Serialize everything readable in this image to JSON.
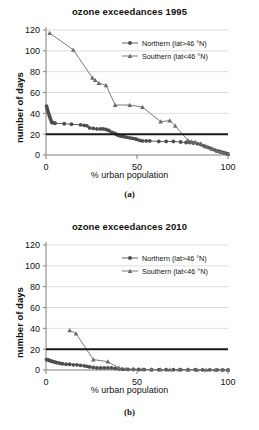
{
  "figure": {
    "panels": [
      {
        "caption": "(a)",
        "chart_data": {
          "type": "line",
          "title": "ozone exceedances 1995",
          "xlabel": "% urban population",
          "ylabel": "number of days",
          "xlim": [
            0,
            100
          ],
          "ylim": [
            0,
            120
          ],
          "xticks": [
            0,
            50,
            100
          ],
          "yticks": [
            0,
            20,
            40,
            60,
            80,
            100,
            120
          ],
          "grid": "horizontal",
          "legend_position": "top-right",
          "threshold_line": {
            "label": "limit value",
            "value": 20,
            "color": "#1a1a1a"
          },
          "series": [
            {
              "name": "Northern (lat>46 °N)",
              "marker": "circle",
              "color": "#4d4d4d",
              "points": [
                [
                  0.3,
                  47
                ],
                [
                  0.6,
                  45
                ],
                [
                  0.9,
                  43
                ],
                [
                  1.2,
                  41
                ],
                [
                  1.6,
                  39
                ],
                [
                  2.0,
                  37
                ],
                [
                  2.4,
                  35
                ],
                [
                  2.8,
                  33
                ],
                [
                  3.2,
                  31
                ],
                [
                  4.0,
                  31
                ],
                [
                  5.0,
                  30.5
                ],
                [
                  10.0,
                  30
                ],
                [
                  14.0,
                  29.5
                ],
                [
                  19.0,
                  29
                ],
                [
                  21.0,
                  28.5
                ],
                [
                  22.5,
                  28
                ],
                [
                  24.0,
                  26
                ],
                [
                  26.0,
                  25.5
                ],
                [
                  28.0,
                  25
                ],
                [
                  30.0,
                  25
                ],
                [
                  31.5,
                  25
                ],
                [
                  33.0,
                  24.5
                ],
                [
                  34.5,
                  23.5
                ],
                [
                  36.0,
                  22
                ],
                [
                  37.5,
                  21
                ],
                [
                  38.5,
                  20
                ],
                [
                  39.5,
                  19
                ],
                [
                  40.5,
                  18.5
                ],
                [
                  41.5,
                  18
                ],
                [
                  43.0,
                  17.5
                ],
                [
                  44.5,
                  17
                ],
                [
                  46.0,
                  16.5
                ],
                [
                  47.5,
                  16
                ],
                [
                  49.0,
                  15.5
                ],
                [
                  50.0,
                  15
                ],
                [
                  51.5,
                  14
                ],
                [
                  53.0,
                  13.5
                ],
                [
                  55.0,
                  13.5
                ],
                [
                  57.0,
                  13.5
                ],
                [
                  62.0,
                  13
                ],
                [
                  66.0,
                  13
                ],
                [
                  70.0,
                  13
                ],
                [
                  74.0,
                  12.5
                ],
                [
                  77.0,
                  12
                ],
                [
                  79.0,
                  12
                ],
                [
                  81.0,
                  11.5
                ],
                [
                  83.0,
                  11
                ],
                [
                  85.0,
                  10
                ],
                [
                  86.5,
                  9
                ],
                [
                  88.0,
                  8
                ],
                [
                  89.5,
                  7
                ],
                [
                  91.0,
                  6
                ],
                [
                  92.5,
                  5
                ],
                [
                  94.0,
                  4
                ],
                [
                  95.0,
                  3.5
                ],
                [
                  96.0,
                  3
                ],
                [
                  97.0,
                  2.5
                ],
                [
                  98.0,
                  2
                ],
                [
                  99.0,
                  1.5
                ],
                [
                  100.0,
                  1
                ]
              ]
            },
            {
              "name": "Southern (lat<46 °N)",
              "marker": "triangle",
              "color": "#6b6b6b",
              "points": [
                [
                  2.0,
                  117
                ],
                [
                  15.0,
                  101
                ],
                [
                  25.5,
                  74
                ],
                [
                  27.0,
                  72
                ],
                [
                  29.0,
                  69
                ],
                [
                  33.0,
                  67
                ],
                [
                  38.0,
                  48
                ],
                [
                  46.0,
                  48
                ],
                [
                  53.0,
                  46
                ],
                [
                  63.0,
                  32
                ],
                [
                  68.0,
                  33
                ],
                [
                  71.0,
                  28
                ],
                [
                  78.0,
                  14
                ],
                [
                  80.0,
                  13
                ],
                [
                  82.0,
                  12.5
                ],
                [
                  85.0,
                  11
                ],
                [
                  88.0,
                  8
                ],
                [
                  91.0,
                  6
                ],
                [
                  94.0,
                  4
                ],
                [
                  96.0,
                  3
                ],
                [
                  98.0,
                  2
                ],
                [
                  100.0,
                  1
                ]
              ]
            }
          ]
        }
      },
      {
        "caption": "(b)",
        "chart_data": {
          "type": "line",
          "title": "ozone exceedances 2010",
          "xlabel": "% urban population",
          "ylabel": "number of days",
          "xlim": [
            0,
            100
          ],
          "ylim": [
            0,
            120
          ],
          "xticks": [
            0,
            50,
            100
          ],
          "yticks": [
            0,
            20,
            40,
            60,
            80,
            100,
            120
          ],
          "grid": "horizontal",
          "legend_position": "top-right",
          "threshold_line": {
            "label": "limit value",
            "value": 20,
            "color": "#1a1a1a"
          },
          "series": [
            {
              "name": "Northern (lat>46 °N)",
              "marker": "circle",
              "color": "#4d4d4d",
              "points": [
                [
                  0.3,
                  10
                ],
                [
                  0.8,
                  10
                ],
                [
                  1.5,
                  9.5
                ],
                [
                  2.2,
                  9
                ],
                [
                  3.0,
                  8.5
                ],
                [
                  4.0,
                  8
                ],
                [
                  5.0,
                  7.5
                ],
                [
                  6.0,
                  7
                ],
                [
                  7.5,
                  6.5
                ],
                [
                  9.0,
                  6
                ],
                [
                  11.0,
                  5.5
                ],
                [
                  13.0,
                  5.5
                ],
                [
                  15.0,
                  5
                ],
                [
                  17.0,
                  5
                ],
                [
                  19.0,
                  4.5
                ],
                [
                  21.0,
                  4
                ],
                [
                  22.5,
                  3.5
                ],
                [
                  24.0,
                  3
                ],
                [
                  26.0,
                  2.5
                ],
                [
                  28.0,
                  2
                ],
                [
                  30.0,
                  2
                ],
                [
                  32.0,
                  2
                ],
                [
                  34.0,
                  2
                ],
                [
                  36.0,
                  2
                ],
                [
                  38.0,
                  1.5
                ],
                [
                  40.0,
                  1
                ],
                [
                  42.0,
                  0.8
                ],
                [
                  45.0,
                  0.6
                ],
                [
                  48.0,
                  0.5
                ],
                [
                  51.0,
                  0.5
                ],
                [
                  54.0,
                  0.4
                ],
                [
                  58.0,
                  0.4
                ],
                [
                  62.0,
                  0.3
                ],
                [
                  66.0,
                  0.3
                ],
                [
                  70.0,
                  0.3
                ],
                [
                  74.0,
                  0.3
                ],
                [
                  78.0,
                  0.3
                ],
                [
                  82.0,
                  0.3
                ],
                [
                  86.0,
                  0.2
                ],
                [
                  90.0,
                  0.2
                ],
                [
                  94.0,
                  0.2
                ],
                [
                  97.0,
                  0.2
                ],
                [
                  100.0,
                  0.2
                ]
              ]
            },
            {
              "name": "Southern (lat<46 °N)",
              "marker": "triangle",
              "color": "#6b6b6b",
              "points": [
                [
                  13.0,
                  38
                ],
                [
                  16.5,
                  35
                ],
                [
                  26.0,
                  10
                ],
                [
                  34.0,
                  8
                ],
                [
                  40.0,
                  2
                ],
                [
                  44.0,
                  1
                ],
                [
                  48.0,
                  0.8
                ],
                [
                  53.0,
                  0.6
                ],
                [
                  58.0,
                  0.5
                ],
                [
                  63.0,
                  0.5
                ],
                [
                  68.0,
                  0.4
                ],
                [
                  73.0,
                  0.4
                ],
                [
                  78.0,
                  0.3
                ],
                [
                  83.0,
                  0.3
                ],
                [
                  88.0,
                  0.3
                ],
                [
                  93.0,
                  0.3
                ],
                [
                  97.0,
                  0.2
                ],
                [
                  100.0,
                  0.2
                ]
              ]
            }
          ]
        }
      }
    ]
  }
}
